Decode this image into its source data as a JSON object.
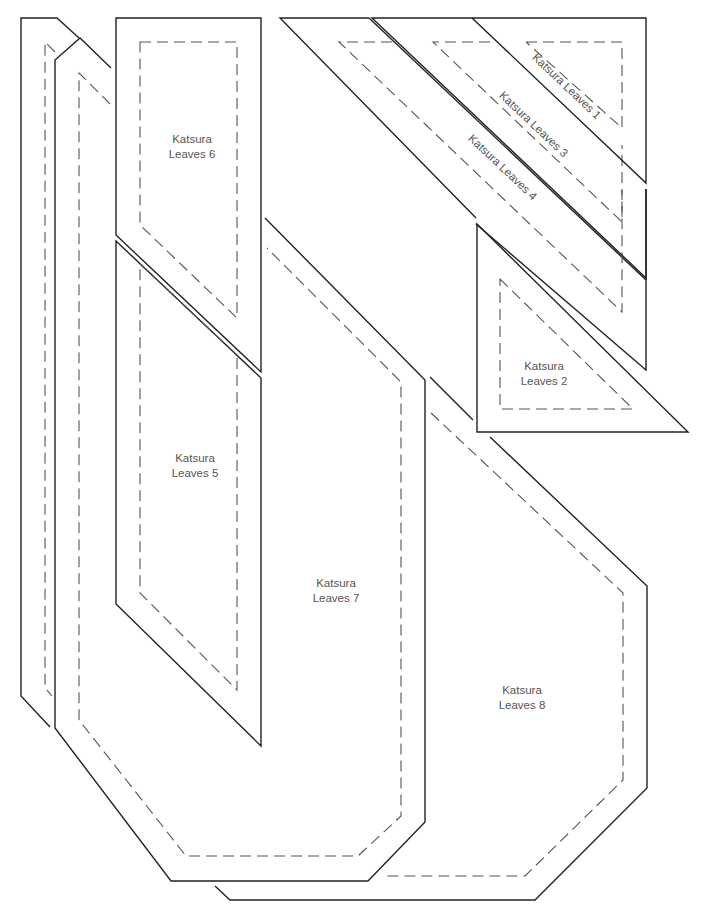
{
  "diagram": {
    "type": "quilt-pattern-templates",
    "colors": {
      "background": "#ffffff",
      "cut_line": "#222222",
      "seam_line": "#555555",
      "label_text": "#555555"
    },
    "legend_semantics": {
      "solid_line": "cutting line",
      "dashed_line": "seam line"
    },
    "pieces": [
      {
        "id": "leaves-1",
        "line1": "Katsura Leaves 1",
        "line2": ""
      },
      {
        "id": "leaves-2",
        "line1": "Katsura",
        "line2": "Leaves 2"
      },
      {
        "id": "leaves-3",
        "line1": "Katsura Leaves 3",
        "line2": ""
      },
      {
        "id": "leaves-4",
        "line1": "Katsura Leaves 4",
        "line2": ""
      },
      {
        "id": "leaves-5",
        "line1": "Katsura",
        "line2": "Leaves 5"
      },
      {
        "id": "leaves-6",
        "line1": "Katsura",
        "line2": "Leaves 6"
      },
      {
        "id": "leaves-7",
        "line1": "Katsura",
        "line2": "Leaves 7"
      },
      {
        "id": "leaves-8",
        "line1": "Katsura",
        "line2": "Leaves 8"
      }
    ]
  }
}
